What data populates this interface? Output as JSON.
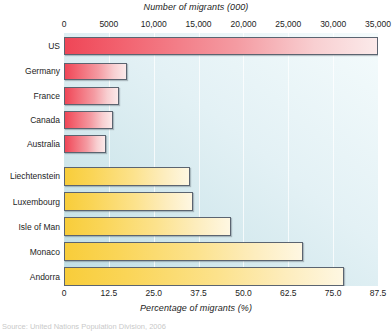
{
  "chart_data": {
    "type": "bar",
    "orientation": "horizontal",
    "title": "",
    "panels": [
      {
        "name": "absolute",
        "xlabel": "Number of migrants (000)",
        "xlim": [
          0,
          35000
        ],
        "xticks": [
          0,
          5000,
          10000,
          15000,
          20000,
          25000,
          30000,
          35000
        ],
        "xticklabels": [
          "0",
          "5000",
          "10,000",
          "15,000",
          "20,000",
          "25,000",
          "30,000",
          "35,000"
        ],
        "categories": [
          "US",
          "Germany",
          "France",
          "Canada",
          "Australia"
        ],
        "values": [
          35000,
          7000,
          6100,
          5500,
          4700
        ],
        "bar_color_start": "#ef4657",
        "bar_color_end": "#fbeaea"
      },
      {
        "name": "percentage",
        "xlabel": "Percentage of migrants (%)",
        "xlim": [
          0,
          87.5
        ],
        "xticks": [
          0,
          12.5,
          25.0,
          37.5,
          50.0,
          62.5,
          75.0,
          87.5
        ],
        "xticklabels": [
          "0",
          "12.5",
          "25.0",
          "37.5",
          "50.0",
          "62.5",
          "75.0",
          "87.5"
        ],
        "categories": [
          "Liechtenstein",
          "Luxembourg",
          "Isle of Man",
          "Monaco",
          "Andorra"
        ],
        "values": [
          35.0,
          36.0,
          46.5,
          66.5,
          78.0
        ],
        "bar_color_start": "#f8cd3a",
        "bar_color_end": "#fef7e2"
      }
    ],
    "grid": true,
    "legend": false,
    "background_color": "#dff0f4"
  },
  "titles": {
    "top_axis": "Number of migrants (000)",
    "bottom_axis": "Percentage of migrants (%)"
  },
  "source": "Source: United Nations Population Division, 2006"
}
